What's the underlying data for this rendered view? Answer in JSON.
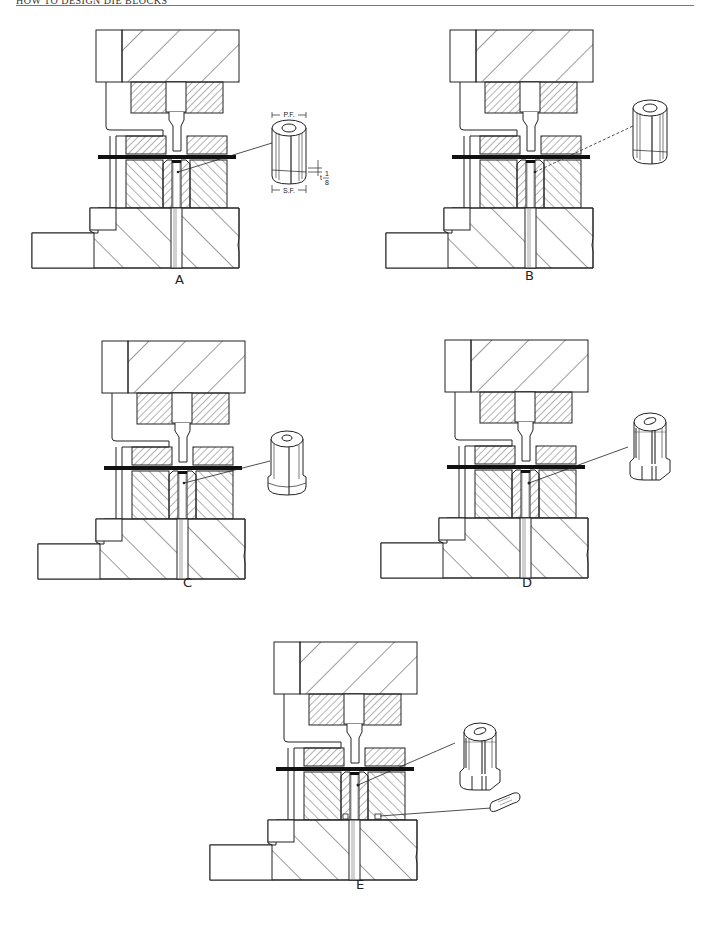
{
  "page": {
    "running_head": "HOW TO DESIGN DIE BLOCKS",
    "page_number": ""
  },
  "figures": [
    {
      "id": "A",
      "label": "A",
      "insert": "round bushing",
      "dimension_labels": {
        "top": "P.F.",
        "bottom": "S.F.",
        "side_t": "t",
        "side_num": "1",
        "side_den": "8"
      }
    },
    {
      "id": "B",
      "label": "B",
      "insert": "round bushing with key flat"
    },
    {
      "id": "C",
      "label": "C",
      "insert": "flanged round bushing"
    },
    {
      "id": "D",
      "label": "D",
      "insert": "flanged bushing with flat"
    },
    {
      "id": "E",
      "label": "E",
      "insert": "flanged bushing with key",
      "extra_part": "key"
    }
  ],
  "colors": {
    "ink": "#1a1a1a",
    "paper": "#ffffff",
    "stock": "#111111"
  }
}
